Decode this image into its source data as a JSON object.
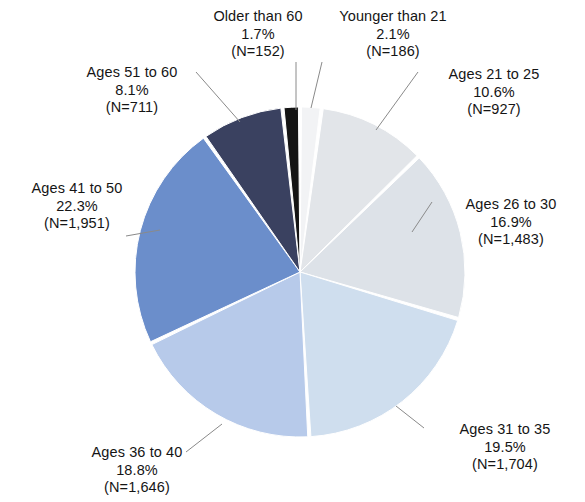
{
  "chart_data": {
    "type": "pie",
    "title": "",
    "subtitle": "",
    "xlabel": "",
    "ylabel": "",
    "legend_position": "none",
    "grid": false,
    "labels_show": [
      "category",
      "percent",
      "count"
    ],
    "total_count": 8760,
    "start_angle_deg": 0,
    "direction": "clockwise",
    "categories": [
      "Younger than 21",
      "Ages 21 to 25",
      "Ages 26 to 30",
      "Ages 31 to 35",
      "Ages 36 to 40",
      "Ages 41 to 50",
      "Ages 51 to 60",
      "Older than 60"
    ],
    "values": [
      2.1,
      10.6,
      16.9,
      19.5,
      18.8,
      22.3,
      8.1,
      1.7
    ],
    "counts": [
      186,
      927,
      1483,
      1704,
      1646,
      1951,
      711,
      152
    ],
    "colors": [
      "#f2f3f5",
      "#e2e5e9",
      "#dde2e8",
      "#cfdeee",
      "#b7caea",
      "#6b8ecb",
      "#3a4160",
      "#141414"
    ],
    "slices": [
      {
        "name": "Younger than 21",
        "percent": "2.1%",
        "count_label": "(N=186)",
        "value": 2.1,
        "count": 186,
        "color": "#f2f3f5"
      },
      {
        "name": "Ages 21 to 25",
        "percent": "10.6%",
        "count_label": "(N=927)",
        "value": 10.6,
        "count": 927,
        "color": "#e2e5e9"
      },
      {
        "name": "Ages 26 to 30",
        "percent": "16.9%",
        "count_label": "(N=1,483)",
        "value": 16.9,
        "count": 1483,
        "color": "#dde2e8"
      },
      {
        "name": "Ages 31 to 35",
        "percent": "19.5%",
        "count_label": "(N=1,704)",
        "value": 19.5,
        "count": 1704,
        "color": "#cfdeee"
      },
      {
        "name": "Ages 36 to 40",
        "percent": "18.8%",
        "count_label": "(N=1,646)",
        "value": 18.8,
        "count": 1646,
        "color": "#b7caea"
      },
      {
        "name": "Ages 41 to 50",
        "percent": "22.3%",
        "count_label": "(N=1,951)",
        "value": 22.3,
        "count": 1951,
        "color": "#6b8ecb"
      },
      {
        "name": "Ages 51 to 60",
        "percent": "8.1%",
        "count_label": "(N=711)",
        "value": 8.1,
        "count": 711,
        "color": "#3a4160"
      },
      {
        "name": "Older than 60",
        "percent": "1.7%",
        "count_label": "(N=152)",
        "value": 1.7,
        "count": 152,
        "color": "#141414"
      }
    ]
  },
  "labels": {
    "older_than_60": {
      "name": "Older than 60",
      "percent": "1.7%",
      "count": "(N=152)"
    },
    "younger_than_21": {
      "name": "Younger than 21",
      "percent": "2.1%",
      "count": "(N=186)"
    },
    "ages_21_25": {
      "name": "Ages 21 to 25",
      "percent": "10.6%",
      "count": "(N=927)"
    },
    "ages_26_30": {
      "name": "Ages 26 to 30",
      "percent": "16.9%",
      "count": "(N=1,483)"
    },
    "ages_31_35": {
      "name": "Ages 31 to 35",
      "percent": "19.5%",
      "count": "(N=1,704)"
    },
    "ages_36_40": {
      "name": "Ages 36 to 40",
      "percent": "18.8%",
      "count": "(N=1,646)"
    },
    "ages_41_50": {
      "name": "Ages 41 to 50",
      "percent": "22.3%",
      "count": "(N=1,951)"
    },
    "ages_51_60": {
      "name": "Ages 51 to 60",
      "percent": "8.1%",
      "count": "(N=711)"
    }
  },
  "geometry": {
    "center_x": 300,
    "center_y": 272,
    "radius": 165,
    "gap_deg": 1.1
  },
  "leader_lines": [
    {
      "name": "leader-older-than-60",
      "x1": 296,
      "y1": 62,
      "x2": 296,
      "y2": 110
    },
    {
      "name": "leader-younger-than-21",
      "x1": 322,
      "y1": 62,
      "x2": 311,
      "y2": 108
    },
    {
      "name": "leader-ages-21-25",
      "x1": 418,
      "y1": 72,
      "x2": 376,
      "y2": 130
    },
    {
      "name": "leader-ages-26-30",
      "x1": 432,
      "y1": 202,
      "x2": 412,
      "y2": 232
    },
    {
      "name": "leader-ages-31-35",
      "x1": 424,
      "y1": 428,
      "x2": 396,
      "y2": 406
    },
    {
      "name": "leader-ages-36-40",
      "x1": 186,
      "y1": 452,
      "x2": 222,
      "y2": 424
    },
    {
      "name": "leader-ages-41-50",
      "x1": 126,
      "y1": 236,
      "x2": 160,
      "y2": 230
    },
    {
      "name": "leader-ages-51-60",
      "x1": 196,
      "y1": 72,
      "x2": 240,
      "y2": 122
    }
  ],
  "colors": {
    "background": "#ffffff",
    "text": "#151515",
    "leader_line": "#8a8a8a",
    "slice_separator": "#ffffff"
  }
}
